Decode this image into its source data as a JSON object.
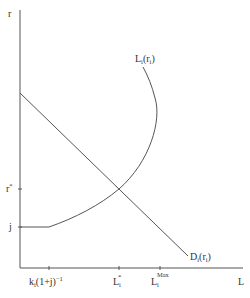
{
  "diagram": {
    "type": "economic-diagram",
    "axes": {
      "y_label": "r",
      "x_label": "L",
      "y_ticks": [
        {
          "label": "r",
          "sup": "*",
          "name": "r-star"
        },
        {
          "label": "j",
          "name": "j"
        }
      ],
      "x_ticks": [
        {
          "label": "k",
          "sub": "i",
          "rest": "(1+j)",
          "sup": "−1",
          "name": "k-i-1-plus-j-inverse"
        },
        {
          "label": "L",
          "sub": "i",
          "sup": "*",
          "name": "L-i-star"
        },
        {
          "label": "L",
          "sub": "i",
          "sup": "Max",
          "name": "L-i-max"
        }
      ]
    },
    "curves": [
      {
        "name": "supply-curve",
        "label": "L",
        "sub": "i",
        "arg": "(r",
        "arg_sub": "i",
        "arg_close": ")"
      },
      {
        "name": "demand-curve",
        "label": "D",
        "sub": "i",
        "arg": "(r",
        "arg_sub": "i",
        "arg_close": ")"
      }
    ],
    "colors": {
      "line": "#555555",
      "text": "#333333",
      "background": "#ffffff"
    }
  }
}
